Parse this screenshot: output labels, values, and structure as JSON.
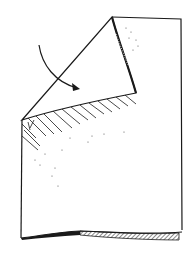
{
  "figure": {
    "ink_color": "#1a1a1a",
    "background_color": "#ffffff",
    "elements": {
      "sheet": "paper-sheet",
      "folded_flap": "folded-corner-flap",
      "arrow": "curved-fold-arrow",
      "crease_hatching": "shadow-hatching-under-fold",
      "bottom_curl": "curled-bottom-edge"
    }
  }
}
